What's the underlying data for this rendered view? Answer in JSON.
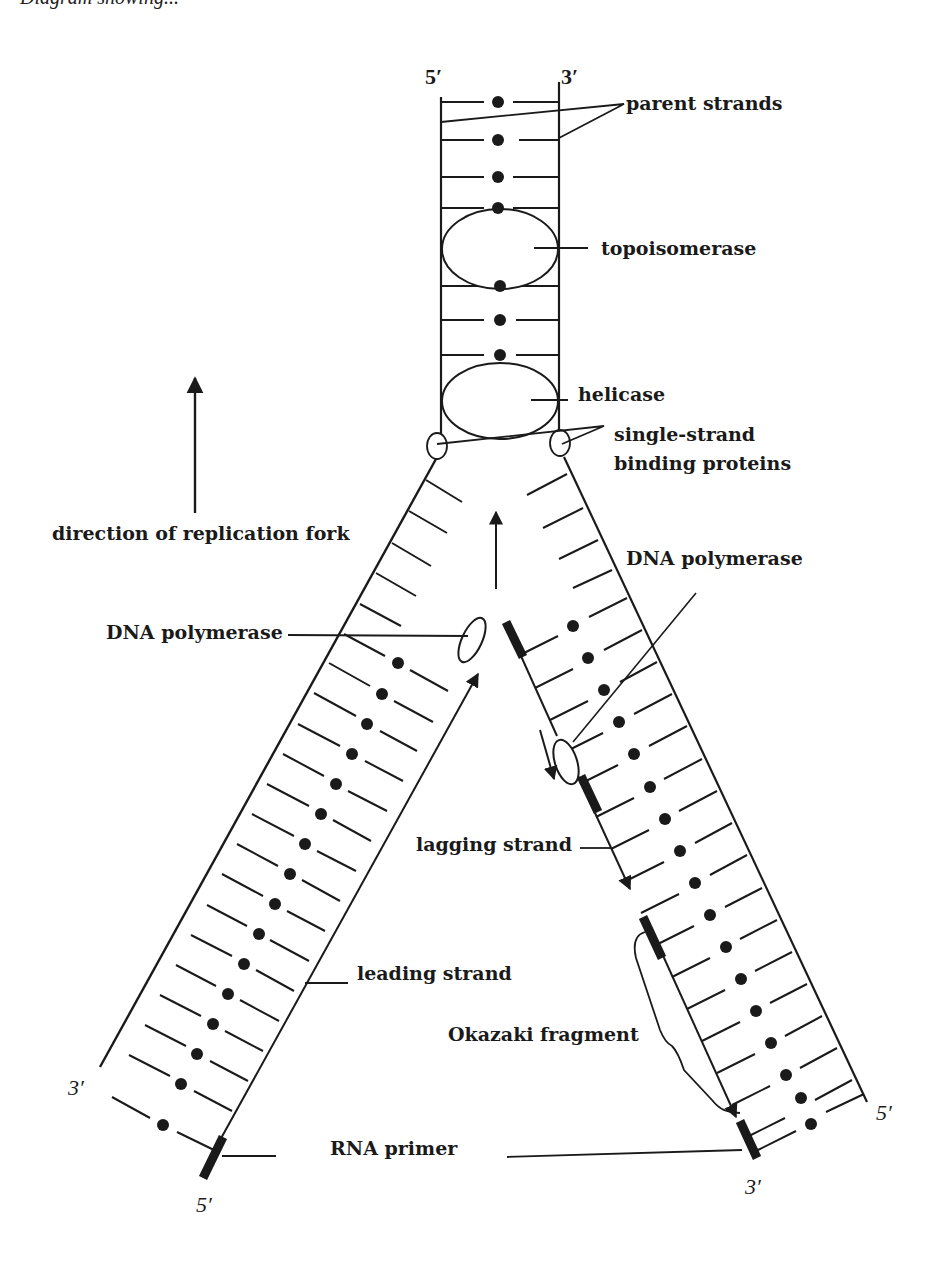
{
  "figure": {
    "title_fragment": "Diagram showing...",
    "top_strand_ends": {
      "left": "5′",
      "right": "3′"
    },
    "left_arm_ends": {
      "outer": "3′",
      "inner": "5′"
    },
    "right_arm_ends": {
      "outer": "5′",
      "inner": "3′"
    }
  },
  "labels": {
    "parent_strands": "parent strands",
    "topoisomerase": "topoisomerase",
    "helicase": "helicase",
    "ssb_line1": "single-strand",
    "ssb_line2": "binding proteins",
    "direction": "direction of replication fork",
    "dna_polymerase_left": "DNA polymerase",
    "dna_polymerase_right": "DNA polymerase",
    "lagging_strand": "lagging strand",
    "leading_strand": "leading strand",
    "okazaki_fragment": "Okazaki fragment",
    "rna_primer": "RNA primer"
  },
  "colors": {
    "ink": "#1a1a1a",
    "background": "#ffffff"
  }
}
